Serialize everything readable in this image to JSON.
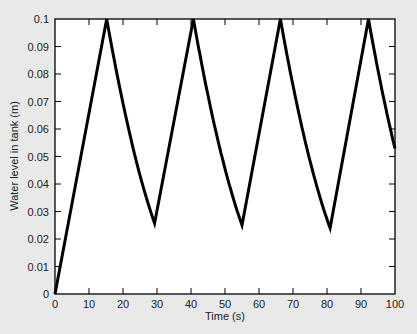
{
  "chart_data": {
    "type": "line",
    "title": "",
    "xlabel": "Time (s)",
    "ylabel": "Water level in tank (m)",
    "xlim": [
      0,
      100
    ],
    "ylim": [
      0,
      0.1
    ],
    "xticks": [
      0,
      10,
      20,
      30,
      40,
      50,
      60,
      70,
      80,
      90,
      100
    ],
    "yticks": [
      0,
      0.01,
      0.02,
      0.03,
      0.04,
      0.05,
      0.06,
      0.07,
      0.08,
      0.09,
      0.1
    ],
    "xtick_labels": [
      "0",
      "10",
      "20",
      "30",
      "40",
      "50",
      "60",
      "70",
      "80",
      "90",
      "100"
    ],
    "ytick_labels": [
      "0",
      "0.01",
      "0.02",
      "0.03",
      "0.04",
      "0.05",
      "0.06",
      "0.07",
      "0.08",
      "0.09",
      "0.1"
    ],
    "grid": false,
    "legend": null,
    "series": [
      {
        "name": "Water level",
        "color": "#000000",
        "segments": [
          {
            "kind": "fill",
            "x": [
              0,
              15.2
            ],
            "y": [
              0,
              0.1
            ]
          },
          {
            "kind": "drain",
            "x": [
              15.2,
              29.3
            ],
            "y": [
              0.1,
              0.025
            ]
          },
          {
            "kind": "fill",
            "x": [
              29.3,
              40.7
            ],
            "y": [
              0.025,
              0.1
            ]
          },
          {
            "kind": "drain",
            "x": [
              40.7,
              55.0
            ],
            "y": [
              0.1,
              0.025
            ]
          },
          {
            "kind": "fill",
            "x": [
              55.0,
              66.3
            ],
            "y": [
              0.025,
              0.1
            ]
          },
          {
            "kind": "drain",
            "x": [
              66.3,
              80.9
            ],
            "y": [
              0.1,
              0.025
            ]
          },
          {
            "kind": "fill",
            "x": [
              80.9,
              92.2
            ],
            "y": [
              0.025,
              0.1
            ]
          },
          {
            "kind": "drain",
            "x": [
              92.2,
              100
            ],
            "y": [
              0.1,
              0.048
            ]
          }
        ],
        "key_points": [
          {
            "x": 0,
            "y": 0
          },
          {
            "x": 15.2,
            "y": 0.1
          },
          {
            "x": 29.3,
            "y": 0.025
          },
          {
            "x": 40.7,
            "y": 0.1
          },
          {
            "x": 55.0,
            "y": 0.025
          },
          {
            "x": 66.3,
            "y": 0.1
          },
          {
            "x": 80.9,
            "y": 0.025
          },
          {
            "x": 92.2,
            "y": 0.1
          },
          {
            "x": 100,
            "y": 0.048
          }
        ]
      }
    ]
  },
  "colors": {
    "background": "#e9e9e9",
    "plot_area": "#ffffff",
    "line": "#000000",
    "axis": "#000000"
  }
}
